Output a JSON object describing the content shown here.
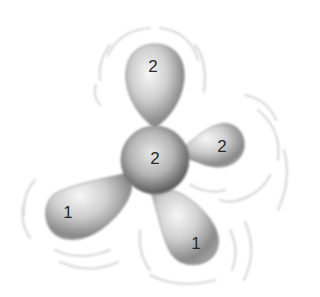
{
  "diagram": {
    "type": "molecular-orbital-illustration",
    "colors": {
      "background": "#ffffff",
      "lobe_light": "#f2f2f2",
      "lobe_mid": "#bdbdbd",
      "lobe_dark": "#6e6e6e",
      "motion_arcs": "#d0d0d0",
      "label_text": "#2a2a2a"
    },
    "lobes": [
      {
        "id": "top",
        "label": "2",
        "x": 153,
        "y": 66
      },
      {
        "id": "center",
        "label": "2",
        "x": 155,
        "y": 158
      },
      {
        "id": "right",
        "label": "2",
        "x": 222,
        "y": 146
      },
      {
        "id": "bottom-left",
        "label": "1",
        "x": 68,
        "y": 212
      },
      {
        "id": "bottom-right",
        "label": "1",
        "x": 196,
        "y": 243
      }
    ]
  }
}
